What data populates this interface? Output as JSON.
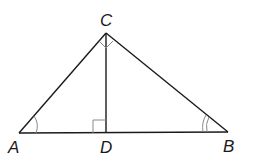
{
  "diagram": {
    "type": "right-triangle-with-altitude",
    "points": {
      "A": {
        "label": "A",
        "x": 19,
        "y": 133
      },
      "B": {
        "label": "B",
        "x": 228,
        "y": 132
      },
      "C": {
        "label": "C",
        "x": 106,
        "y": 33
      },
      "D": {
        "label": "D",
        "x": 106,
        "y": 133
      }
    },
    "segments": [
      "AB",
      "AC",
      "BC",
      "CD"
    ],
    "markings": {
      "right_angle_at_C": "∠ACB = 90°",
      "right_angle_at_D": "CD ⊥ AB",
      "angle_A": "single arc",
      "angle_B": "double arc"
    },
    "colors": {
      "stroke": "#1a1a1a",
      "mark": "#8a8a8a"
    }
  }
}
